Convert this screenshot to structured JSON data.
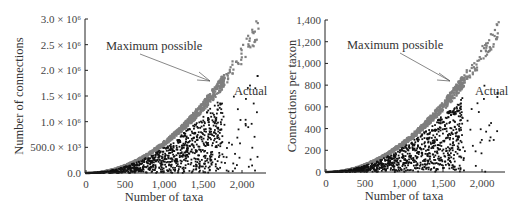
{
  "colors": {
    "max_possible": "#7f7f7f",
    "actual": "#111111",
    "axis": "#222222",
    "background": "#ffffff"
  },
  "chart_data": [
    {
      "type": "scatter",
      "title": "",
      "xlabel": "Number of taxa",
      "ylabel": "Number of connections",
      "xlim": [
        0,
        2300
      ],
      "ylim": [
        0,
        3000000
      ],
      "x_ticks": [
        0,
        500,
        1000,
        1500,
        2000
      ],
      "x_tick_labels": [
        "0",
        "500",
        "1,000",
        "1,500",
        "2,000"
      ],
      "y_ticks": [
        0,
        500000,
        1000000,
        1500000,
        2000000,
        2500000,
        3000000
      ],
      "y_tick_labels": [
        "0.0",
        "500.0 × 10³",
        "1.0 × 10⁶",
        "1.5 × 10⁶",
        "2.0 × 10⁶",
        "2.5 × 10⁶",
        "3.0 × 10⁶"
      ],
      "grid": false,
      "legend": "none (inline annotations)",
      "annotations": [
        {
          "text": "Maximum possible",
          "x": 600,
          "y": 2500000,
          "arrow_to": [
            1600,
            1750000
          ]
        },
        {
          "text": "Actual",
          "x": 1900,
          "y": 1500000
        }
      ],
      "series": [
        {
          "name": "Maximum possible",
          "color": "gray",
          "relation": "y = x²/2 - x/2 (approx. n(n-1)/2)",
          "sample_points": [
            [
              0,
              0
            ],
            [
              500,
              125000
            ],
            [
              1000,
              500000
            ],
            [
              1500,
              1120000
            ],
            [
              1700,
              1450000
            ],
            [
              2000,
              2000000
            ],
            [
              2200,
              2950000
            ]
          ]
        },
        {
          "name": "Actual",
          "color": "black",
          "sample_points": [
            [
              500,
              60000
            ],
            [
              1000,
              300000
            ],
            [
              1300,
              700000
            ],
            [
              1500,
              1250000
            ],
            [
              1700,
              1300000
            ],
            [
              1950,
              200000
            ],
            [
              2200,
              1900000
            ]
          ]
        }
      ]
    },
    {
      "type": "scatter",
      "title": "",
      "xlabel": "Number of taxa",
      "ylabel": "Connections per taxon",
      "xlim": [
        0,
        2300
      ],
      "ylim": [
        0,
        1400
      ],
      "x_ticks": [
        0,
        500,
        1000,
        1500,
        2000
      ],
      "x_tick_labels": [
        "0",
        "500",
        "1,000",
        "1,500",
        "2,000"
      ],
      "y_ticks": [
        0,
        200,
        400,
        600,
        800,
        1000,
        1200,
        1400
      ],
      "y_tick_labels": [
        "0",
        "200",
        "400",
        "600",
        "800",
        "1,000",
        "1,200",
        "1,400"
      ],
      "grid": false,
      "legend": "none (inline annotations)",
      "annotations": [
        {
          "text": "Maximum possible",
          "x": 600,
          "y": 1150,
          "arrow_to": [
            1600,
            820
          ]
        },
        {
          "text": "Actual",
          "x": 1950,
          "y": 700
        }
      ],
      "series": [
        {
          "name": "Maximum possible",
          "color": "gray",
          "sample_points": [
            [
              0,
              0
            ],
            [
              500,
              60
            ],
            [
              1000,
              250
            ],
            [
              1500,
              560
            ],
            [
              1700,
              820
            ],
            [
              2000,
              1100
            ],
            [
              2200,
              1380
            ]
          ]
        },
        {
          "name": "Actual",
          "color": "black",
          "sample_points": [
            [
              500,
              30
            ],
            [
              1000,
              150
            ],
            [
              1300,
              330
            ],
            [
              1500,
              550
            ],
            [
              1700,
              560
            ],
            [
              1950,
              100
            ],
            [
              2200,
              900
            ]
          ]
        }
      ]
    }
  ],
  "panels": [
    {
      "ylabel": "Number of connections",
      "xlabel": "Number of taxa",
      "xticks": [
        "0",
        "500",
        "1,000",
        "1,500",
        "2,000"
      ],
      "yticks": [
        "0.0",
        "500.0 × 10³",
        "1.0 × 10⁶",
        "1.5 × 10⁶",
        "2.0 × 10⁶",
        "2.5 × 10⁶",
        "3.0 × 10⁶"
      ],
      "annotation_max": "Maximum possible",
      "annotation_actual": "Actual"
    },
    {
      "ylabel": "Connections per taxon",
      "xlabel": "Number of taxa",
      "xticks": [
        "0",
        "500",
        "1,000",
        "1,500",
        "2,000"
      ],
      "yticks": [
        "0",
        "200",
        "400",
        "600",
        "800",
        "1,000",
        "1,200",
        "1,400"
      ],
      "annotation_max": "Maximum possible",
      "annotation_actual": "Actual"
    }
  ]
}
